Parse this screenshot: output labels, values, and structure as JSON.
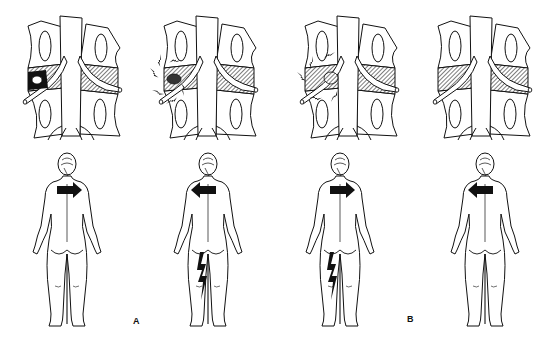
{
  "figure": {
    "labels": [
      {
        "id": "A",
        "text": "A",
        "x": 133,
        "y": 316
      },
      {
        "id": "B",
        "text": "B",
        "x": 407,
        "y": 314
      }
    ],
    "colors": {
      "ink": "#111111",
      "background": "#ffffff",
      "hatch": "#555555"
    }
  },
  "panels": [
    {
      "index": 1,
      "group": "A",
      "spine_center_x": 68,
      "lesion_side": "left",
      "lesion_type": "disc-herniation-dark",
      "pain_burst": false,
      "body_center_x": 67,
      "arrow_direction": "right",
      "leg_pain_bolt": false
    },
    {
      "index": 2,
      "group": "A",
      "spine_center_x": 204,
      "lesion_side": "left",
      "lesion_type": "disc-herniation-pain",
      "pain_burst": true,
      "body_center_x": 208,
      "arrow_direction": "left",
      "leg_pain_bolt": true
    },
    {
      "index": 3,
      "group": "B",
      "spine_center_x": 345,
      "lesion_side": "left",
      "lesion_type": "disc-herniation-pain-medial",
      "pain_burst": true,
      "body_center_x": 340,
      "arrow_direction": "right",
      "leg_pain_bolt": true
    },
    {
      "index": 4,
      "group": "B",
      "spine_center_x": 478,
      "lesion_side": "none",
      "lesion_type": "normal",
      "pain_burst": false,
      "body_center_x": 485,
      "arrow_direction": "left",
      "leg_pain_bolt": false
    }
  ]
}
